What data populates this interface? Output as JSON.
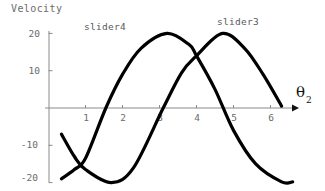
{
  "chart_data": {
    "type": "line",
    "title": "",
    "xlabel": "θ₂",
    "ylabel": "Velocity",
    "xlim": [
      0,
      6.6
    ],
    "ylim": [
      -21,
      21
    ],
    "grid": false,
    "legend_position": "inline-above-curves",
    "x_ticks": [
      1,
      2,
      3,
      4,
      5,
      6
    ],
    "x_tick_labels": [
      "1",
      "2",
      "3",
      "4",
      "5",
      "6"
    ],
    "y_ticks": [
      20,
      10,
      -10,
      -20
    ],
    "y_tick_labels": [
      "20",
      "10",
      "-10",
      "-20"
    ],
    "series": [
      {
        "name": "slider4",
        "color": "#000000",
        "description": "Sinusoid, amplitude 20, peak +20 near θ₂=3.2, zero crossing rising at 1.55, minimum -20 at right edge",
        "x": [
          0.35,
          0.7,
          1.0,
          1.55,
          2.0,
          2.5,
          3.2,
          3.8,
          4.0,
          4.5,
          5.0,
          5.6,
          6.3,
          6.6
        ],
        "y": [
          -19.0,
          -16.5,
          -13.5,
          0.0,
          9.0,
          16.0,
          20.0,
          17.0,
          14.0,
          5.0,
          -6.0,
          -15.0,
          -19.8,
          -19.8
        ]
      },
      {
        "name": "slider3",
        "color": "#000000",
        "description": "Sinusoid, amplitude 20, minimum -20 near θ₂=1.7, zero crossing rising at 3.1, peak +20 near θ₂=4.7",
        "x": [
          0.35,
          0.7,
          1.0,
          1.7,
          2.3,
          3.1,
          3.6,
          4.0,
          4.7,
          5.3,
          5.8,
          6.3
        ],
        "y": [
          -7.0,
          -13.0,
          -16.5,
          -20.0,
          -16.0,
          0.0,
          9.5,
          14.0,
          20.0,
          16.0,
          9.0,
          0.5
        ]
      }
    ],
    "annotations": [
      {
        "text": "slider4",
        "x": 1.0,
        "y": 22.0
      },
      {
        "text": "slider3",
        "x": 4.6,
        "y": 23.0
      }
    ]
  },
  "axes": {
    "y_title": "Velocity",
    "x_title_base": "θ",
    "x_title_sub": "2"
  }
}
